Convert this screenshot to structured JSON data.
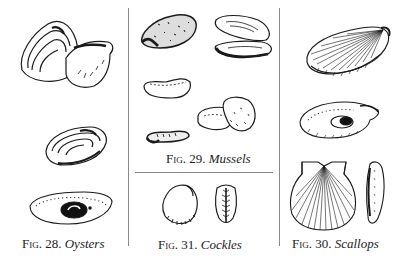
{
  "figures": [
    {
      "id": "fig-28",
      "label_prefix": "Fig.",
      "number": "28.",
      "name": "Oysters",
      "drawings": [
        "oyster-pair-closed-and-open",
        "oyster-shell-side",
        "oyster-shell-interior-with-muscle-scar"
      ]
    },
    {
      "id": "fig-29",
      "label_prefix": "Fig.",
      "number": "29.",
      "name": "Mussels",
      "drawings": [
        "mussel-closed-dark",
        "mussel-open-valves",
        "mussel-flat-shell",
        "mussel-pair-pale",
        "mussel-small-elongated"
      ]
    },
    {
      "id": "fig-31",
      "label_prefix": "Fig.",
      "number": "31.",
      "name": "Cockles",
      "drawings": [
        "cockle-side-ribbed",
        "cockle-end-view-hinge"
      ]
    },
    {
      "id": "fig-30",
      "label_prefix": "Fig.",
      "number": "30.",
      "name": "Scallops",
      "drawings": [
        "scallop-ribbed-side",
        "scallop-interior-with-adductor",
        "scallop-fan-shell",
        "scallop-edge-view"
      ]
    }
  ],
  "colors": {
    "ink": "#1a1a1a",
    "rule": "#8a8a8a",
    "paper": "#ffffff"
  }
}
